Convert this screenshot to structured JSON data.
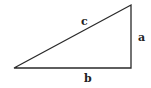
{
  "diagram": {
    "type": "right-triangle",
    "labels": {
      "hypotenuse": "c",
      "vertical_leg": "a",
      "horizontal_leg": "b"
    },
    "stroke_color": "#2a2a2a"
  }
}
